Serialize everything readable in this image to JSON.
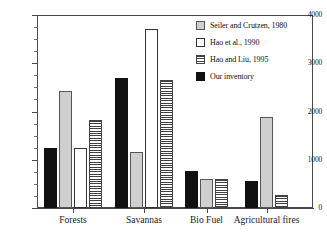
{
  "chart_data": {
    "type": "bar",
    "title": "",
    "subtitle": "",
    "xlabel": "",
    "ylabel": "",
    "ylim": [
      0,
      4000
    ],
    "ytick_labels": [
      "0",
      "1000",
      "2000",
      "3000",
      "4000"
    ],
    "ytick_values": [
      0,
      1000,
      2000,
      3000,
      4000
    ],
    "yminor_step": 250,
    "grid": false,
    "legend_position": "top-right",
    "categories": [
      "Forests",
      "Savannas",
      "Bio Fuel",
      "Agricultural fires"
    ],
    "series": [
      {
        "name": "Our inventory",
        "fill": "solid-black",
        "color": "#111111",
        "values": [
          1250,
          2700,
          770,
          550
        ]
      },
      {
        "name": "Seiler and Crutzen, 1980",
        "fill": "solid-light-gray",
        "color": "#cfcfcf",
        "values": [
          2420,
          1170,
          600,
          1880
        ]
      },
      {
        "name": "Hao et al., 1990",
        "fill": "empty-white",
        "color": "#ffffff",
        "values": [
          1250,
          3700,
          0,
          0
        ]
      },
      {
        "name": "Hao and Liu, 1995",
        "fill": "horizontal-stripes",
        "color": "#3f3f3f",
        "values": [
          1820,
          2660,
          600,
          280
        ]
      }
    ],
    "legend_order": [
      "Seiler and Crutzen, 1980",
      "Hao et al., 1990",
      "Hao and Liu, 1995",
      "Our inventory"
    ]
  },
  "legend": {
    "items": [
      {
        "label": "Seiler and Crutzen, 1980",
        "swatch": "solid-light-gray"
      },
      {
        "label": "Hao et al., 1990",
        "swatch": "empty-white"
      },
      {
        "label": "Hao and Liu, 1995",
        "swatch": "horizontal-stripes"
      },
      {
        "label": "Our inventory",
        "swatch": "solid-black"
      }
    ]
  },
  "axes": {
    "y_labels": [
      "4000",
      "3000",
      "2000",
      "1000",
      "0"
    ],
    "x_labels": [
      "Forests",
      "Savannas",
      "Bio Fuel",
      "Agricultural fires"
    ]
  }
}
